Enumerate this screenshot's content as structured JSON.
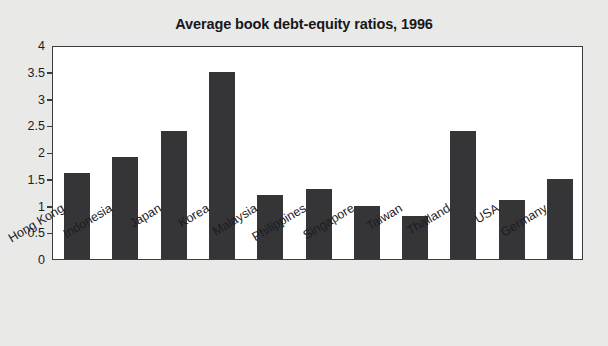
{
  "chart_data": {
    "type": "bar",
    "title": "Average book debt-equity ratios, 1996",
    "xlabel": "",
    "ylabel": "",
    "ylim": [
      0,
      4
    ],
    "yticks": [
      "0",
      "0.5",
      "1",
      "1.5",
      "2",
      "2.5",
      "3",
      "3.5",
      "4"
    ],
    "ytick_values": [
      0,
      0.5,
      1,
      1.5,
      2,
      2.5,
      3,
      3.5,
      4
    ],
    "grid": false,
    "legend": null,
    "categories": [
      "Hong Kong",
      "Indonesia",
      "Japan",
      "Korea",
      "Malaysia",
      "Philippines",
      "Singapore",
      "Taiwan",
      "Thailand",
      "USA",
      "Germany"
    ],
    "values": [
      1.6,
      1.9,
      2.4,
      3.5,
      1.2,
      1.3,
      1.0,
      0.8,
      2.4,
      1.1,
      1.5
    ],
    "bar_color": "#353538",
    "plot_background": "#ffffff",
    "figure_background": "#e9e9e7",
    "axis_color": "#3c3c40",
    "text_color": "#1c1c1f"
  }
}
